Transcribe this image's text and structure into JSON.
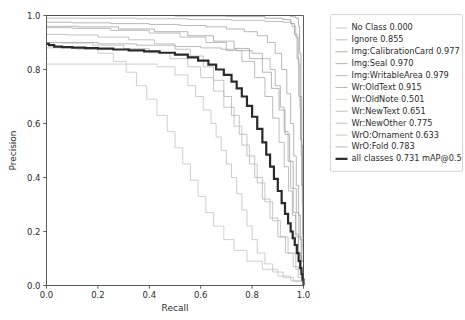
{
  "chart_data": {
    "type": "line",
    "title": "",
    "xlabel": "Recall",
    "ylabel": "Precision",
    "xlim": [
      0.0,
      1.0
    ],
    "ylim": [
      0.0,
      1.0
    ],
    "xticks": [
      "0.0",
      "0.2",
      "0.4",
      "0.6",
      "0.8",
      "1.0"
    ],
    "yticks": [
      "0.0",
      "0.2",
      "0.4",
      "0.6",
      "0.8",
      "1.0"
    ],
    "xtick_values": [
      0.0,
      0.2,
      0.4,
      0.6,
      0.8,
      1.0
    ],
    "ytick_values": [
      0.0,
      0.2,
      0.4,
      0.6,
      0.8,
      1.0
    ],
    "grid": false,
    "legend_position": "right-outside",
    "series": [
      {
        "name": "No Class",
        "score": "0.000",
        "label": "No Class 0.000",
        "color": "#b8b8b8",
        "width": 0.7,
        "points": [
          [
            0.0,
            0.82
          ],
          [
            0.02,
            0.82
          ],
          [
            0.3,
            0.82
          ],
          [
            0.43,
            0.81
          ],
          [
            0.5,
            0.78
          ],
          [
            0.55,
            0.74
          ],
          [
            0.58,
            0.7
          ],
          [
            0.61,
            0.65
          ],
          [
            0.64,
            0.6
          ],
          [
            0.66,
            0.55
          ],
          [
            0.68,
            0.5
          ],
          [
            0.7,
            0.45
          ],
          [
            0.72,
            0.4
          ],
          [
            0.74,
            0.34
          ],
          [
            0.76,
            0.28
          ],
          [
            0.78,
            0.22
          ],
          [
            0.8,
            0.17
          ],
          [
            0.82,
            0.12
          ],
          [
            0.85,
            0.08
          ],
          [
            0.88,
            0.05
          ],
          [
            0.92,
            0.03
          ],
          [
            0.96,
            0.015
          ],
          [
            1.0,
            0.0
          ]
        ]
      },
      {
        "name": "Ignore",
        "score": "0.855",
        "label": "Ignore 0.855",
        "color": "#9e9e9e",
        "width": 0.7,
        "points": [
          [
            0.0,
            0.9
          ],
          [
            0.05,
            0.9
          ],
          [
            0.2,
            0.895
          ],
          [
            0.35,
            0.89
          ],
          [
            0.5,
            0.885
          ],
          [
            0.6,
            0.88
          ],
          [
            0.68,
            0.875
          ],
          [
            0.74,
            0.87
          ],
          [
            0.8,
            0.86
          ],
          [
            0.84,
            0.84
          ],
          [
            0.87,
            0.8
          ],
          [
            0.89,
            0.74
          ],
          [
            0.91,
            0.66
          ],
          [
            0.925,
            0.57
          ],
          [
            0.94,
            0.46
          ],
          [
            0.95,
            0.36
          ],
          [
            0.96,
            0.27
          ],
          [
            0.97,
            0.19
          ],
          [
            0.98,
            0.12
          ],
          [
            0.99,
            0.06
          ],
          [
            1.0,
            0.0
          ]
        ]
      },
      {
        "name": "Img:CalibrationCard",
        "score": "0.977",
        "label": "Img:CalibrationCard 0.977",
        "color": "#8c8c8c",
        "width": 0.7,
        "points": [
          [
            0.0,
            1.0
          ],
          [
            0.3,
            1.0
          ],
          [
            0.6,
            1.0
          ],
          [
            0.8,
            1.0
          ],
          [
            0.9,
            1.0
          ],
          [
            0.95,
            0.995
          ],
          [
            0.97,
            0.99
          ],
          [
            0.98,
            0.96
          ],
          [
            0.985,
            0.86
          ],
          [
            0.99,
            0.7
          ],
          [
            0.993,
            0.52
          ],
          [
            0.996,
            0.34
          ],
          [
            0.998,
            0.18
          ],
          [
            1.0,
            0.0
          ]
        ]
      },
      {
        "name": "Img:Seal",
        "score": "0.970",
        "label": "Img:Seal 0.970",
        "color": "#8c8c8c",
        "width": 0.7,
        "points": [
          [
            0.0,
            1.0
          ],
          [
            0.25,
            1.0
          ],
          [
            0.5,
            0.998
          ],
          [
            0.7,
            0.996
          ],
          [
            0.85,
            0.99
          ],
          [
            0.92,
            0.985
          ],
          [
            0.95,
            0.97
          ],
          [
            0.965,
            0.93
          ],
          [
            0.975,
            0.84
          ],
          [
            0.982,
            0.7
          ],
          [
            0.988,
            0.54
          ],
          [
            0.993,
            0.37
          ],
          [
            0.997,
            0.19
          ],
          [
            1.0,
            0.0
          ]
        ]
      },
      {
        "name": "Img:WritableArea",
        "score": "0.979",
        "label": "Img:WritableArea 0.979",
        "color": "#a5a5a5",
        "width": 0.7,
        "points": [
          [
            0.0,
            0.99
          ],
          [
            0.15,
            0.99
          ],
          [
            0.35,
            0.988
          ],
          [
            0.55,
            0.985
          ],
          [
            0.72,
            0.982
          ],
          [
            0.85,
            0.978
          ],
          [
            0.92,
            0.975
          ],
          [
            0.955,
            0.96
          ],
          [
            0.97,
            0.92
          ],
          [
            0.98,
            0.82
          ],
          [
            0.986,
            0.66
          ],
          [
            0.991,
            0.48
          ],
          [
            0.995,
            0.3
          ],
          [
            0.998,
            0.14
          ],
          [
            1.0,
            0.0
          ]
        ]
      },
      {
        "name": "Wr:OldText",
        "score": "0.915",
        "label": "Wr:OldText 0.915",
        "color": "#999999",
        "width": 0.7,
        "points": [
          [
            0.0,
            0.975
          ],
          [
            0.1,
            0.973
          ],
          [
            0.25,
            0.97
          ],
          [
            0.4,
            0.967
          ],
          [
            0.52,
            0.963
          ],
          [
            0.62,
            0.958
          ],
          [
            0.7,
            0.95
          ],
          [
            0.77,
            0.94
          ],
          [
            0.82,
            0.925
          ],
          [
            0.86,
            0.9
          ],
          [
            0.89,
            0.86
          ],
          [
            0.915,
            0.8
          ],
          [
            0.935,
            0.71
          ],
          [
            0.95,
            0.6
          ],
          [
            0.962,
            0.48
          ],
          [
            0.972,
            0.37
          ],
          [
            0.981,
            0.26
          ],
          [
            0.988,
            0.17
          ],
          [
            0.994,
            0.09
          ],
          [
            1.0,
            0.0
          ]
        ]
      },
      {
        "name": "Wr:OldNote",
        "score": "0.501",
        "label": "Wr:OldNote 0.501",
        "color": "#bcbcbc",
        "width": 0.7,
        "points": [
          [
            0.0,
            0.88
          ],
          [
            0.03,
            0.88
          ],
          [
            0.12,
            0.875
          ],
          [
            0.2,
            0.86
          ],
          [
            0.26,
            0.83
          ],
          [
            0.31,
            0.79
          ],
          [
            0.35,
            0.74
          ],
          [
            0.39,
            0.69
          ],
          [
            0.43,
            0.63
          ],
          [
            0.47,
            0.57
          ],
          [
            0.5,
            0.51
          ],
          [
            0.53,
            0.45
          ],
          [
            0.56,
            0.39
          ],
          [
            0.59,
            0.33
          ],
          [
            0.62,
            0.27
          ],
          [
            0.65,
            0.22
          ],
          [
            0.69,
            0.17
          ],
          [
            0.73,
            0.13
          ],
          [
            0.78,
            0.09
          ],
          [
            0.84,
            0.06
          ],
          [
            0.9,
            0.035
          ],
          [
            0.95,
            0.018
          ],
          [
            1.0,
            0.0
          ]
        ]
      },
      {
        "name": "Wr:NewText",
        "score": "0.651",
        "label": "Wr:NewText 0.651",
        "color": "#aaaaaa",
        "width": 0.7,
        "points": [
          [
            0.0,
            0.93
          ],
          [
            0.08,
            0.928
          ],
          [
            0.2,
            0.92
          ],
          [
            0.32,
            0.91
          ],
          [
            0.42,
            0.895
          ],
          [
            0.5,
            0.875
          ],
          [
            0.56,
            0.85
          ],
          [
            0.61,
            0.81
          ],
          [
            0.65,
            0.76
          ],
          [
            0.69,
            0.7
          ],
          [
            0.72,
            0.63
          ],
          [
            0.75,
            0.56
          ],
          [
            0.78,
            0.48
          ],
          [
            0.81,
            0.4
          ],
          [
            0.84,
            0.32
          ],
          [
            0.87,
            0.25
          ],
          [
            0.9,
            0.18
          ],
          [
            0.93,
            0.12
          ],
          [
            0.96,
            0.07
          ],
          [
            0.98,
            0.03
          ],
          [
            1.0,
            0.0
          ]
        ]
      },
      {
        "name": "Wr:NewOther",
        "score": "0.775",
        "label": "Wr:NewOther 0.775",
        "color": "#a0a0a0",
        "width": 0.7,
        "points": [
          [
            0.0,
            0.955
          ],
          [
            0.1,
            0.952
          ],
          [
            0.25,
            0.945
          ],
          [
            0.4,
            0.935
          ],
          [
            0.52,
            0.92
          ],
          [
            0.62,
            0.9
          ],
          [
            0.7,
            0.87
          ],
          [
            0.76,
            0.83
          ],
          [
            0.81,
            0.77
          ],
          [
            0.85,
            0.7
          ],
          [
            0.88,
            0.62
          ],
          [
            0.905,
            0.53
          ],
          [
            0.925,
            0.44
          ],
          [
            0.942,
            0.35
          ],
          [
            0.957,
            0.26
          ],
          [
            0.97,
            0.18
          ],
          [
            0.981,
            0.11
          ],
          [
            0.991,
            0.05
          ],
          [
            1.0,
            0.0
          ]
        ]
      },
      {
        "name": "WrO:Ornament",
        "score": "0.633",
        "label": "WrO:Ornament 0.633",
        "color": "#b0b0b0",
        "width": 0.7,
        "points": [
          [
            0.0,
            0.9
          ],
          [
            0.06,
            0.898
          ],
          [
            0.18,
            0.89
          ],
          [
            0.3,
            0.878
          ],
          [
            0.4,
            0.862
          ],
          [
            0.48,
            0.84
          ],
          [
            0.55,
            0.81
          ],
          [
            0.6,
            0.77
          ],
          [
            0.65,
            0.72
          ],
          [
            0.69,
            0.66
          ],
          [
            0.73,
            0.59
          ],
          [
            0.76,
            0.52
          ],
          [
            0.79,
            0.45
          ],
          [
            0.82,
            0.38
          ],
          [
            0.85,
            0.31
          ],
          [
            0.88,
            0.24
          ],
          [
            0.91,
            0.18
          ],
          [
            0.94,
            0.12
          ],
          [
            0.97,
            0.06
          ],
          [
            1.0,
            0.0
          ]
        ]
      },
      {
        "name": "WrO:Fold",
        "score": "0.783",
        "label": "WrO:Fold 0.783",
        "color": "#969696",
        "width": 0.7,
        "points": [
          [
            0.0,
            0.96
          ],
          [
            0.12,
            0.958
          ],
          [
            0.28,
            0.95
          ],
          [
            0.42,
            0.94
          ],
          [
            0.55,
            0.925
          ],
          [
            0.65,
            0.905
          ],
          [
            0.73,
            0.878
          ],
          [
            0.79,
            0.84
          ],
          [
            0.84,
            0.79
          ],
          [
            0.875,
            0.73
          ],
          [
            0.905,
            0.65
          ],
          [
            0.928,
            0.56
          ],
          [
            0.946,
            0.46
          ],
          [
            0.96,
            0.36
          ],
          [
            0.972,
            0.27
          ],
          [
            0.982,
            0.18
          ],
          [
            0.991,
            0.09
          ],
          [
            1.0,
            0.0
          ]
        ]
      },
      {
        "name": "all classes",
        "score": "0.731",
        "label": "all classes 0.731 mAP@0.5",
        "color": "#2a2a2a",
        "width": 2.2,
        "points": [
          [
            0.0,
            0.895
          ],
          [
            0.01,
            0.89
          ],
          [
            0.03,
            0.885
          ],
          [
            0.06,
            0.883
          ],
          [
            0.1,
            0.881
          ],
          [
            0.15,
            0.879
          ],
          [
            0.2,
            0.877
          ],
          [
            0.26,
            0.874
          ],
          [
            0.32,
            0.871
          ],
          [
            0.38,
            0.867
          ],
          [
            0.44,
            0.862
          ],
          [
            0.5,
            0.855
          ],
          [
            0.55,
            0.845
          ],
          [
            0.59,
            0.833
          ],
          [
            0.63,
            0.818
          ],
          [
            0.66,
            0.8
          ],
          [
            0.69,
            0.78
          ],
          [
            0.72,
            0.755
          ],
          [
            0.74,
            0.73
          ],
          [
            0.76,
            0.7
          ],
          [
            0.78,
            0.665
          ],
          [
            0.8,
            0.625
          ],
          [
            0.82,
            0.58
          ],
          [
            0.84,
            0.53
          ],
          [
            0.855,
            0.485
          ],
          [
            0.87,
            0.44
          ],
          [
            0.885,
            0.395
          ],
          [
            0.9,
            0.35
          ],
          [
            0.915,
            0.305
          ],
          [
            0.928,
            0.265
          ],
          [
            0.94,
            0.23
          ],
          [
            0.95,
            0.2
          ],
          [
            0.958,
            0.175
          ],
          [
            0.966,
            0.15
          ],
          [
            0.974,
            0.12
          ],
          [
            0.981,
            0.09
          ],
          [
            0.987,
            0.065
          ],
          [
            0.992,
            0.042
          ],
          [
            0.996,
            0.022
          ],
          [
            1.0,
            0.0
          ]
        ]
      }
    ]
  },
  "legend": {
    "entries": [
      "No Class 0.000",
      "Ignore 0.855",
      "Img:CalibrationCard 0.977",
      "Img:Seal 0.970",
      "Img:WritableArea 0.979",
      "Wr:OldText 0.915",
      "Wr:OldNote 0.501",
      "Wr:NewText 0.651",
      "Wr:NewOther 0.775",
      "WrO:Ornament 0.633",
      "WrO:Fold 0.783",
      "all classes 0.731 mAP@0.5"
    ]
  }
}
